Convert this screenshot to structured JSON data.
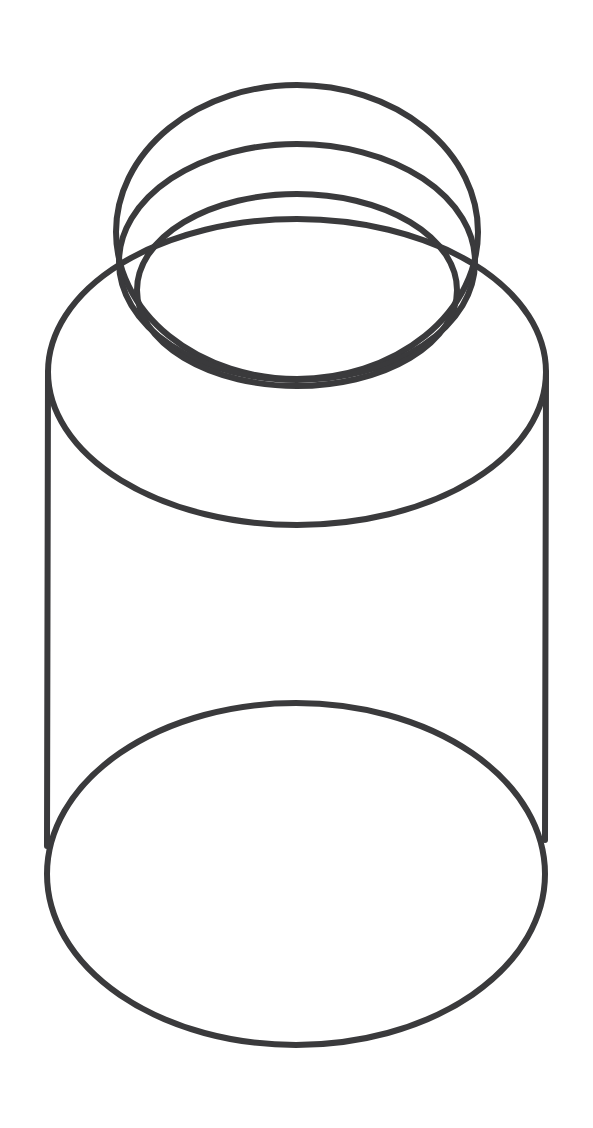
{
  "figure": {
    "view": "three-quarter perspective line drawing",
    "style": "black-and-white line art, no fill",
    "background_color": "#ffffff",
    "line_color": "#3a3a3c",
    "line_width": 6,
    "canvas": {
      "width": 593,
      "height": 1128
    }
  },
  "parts": [
    {
      "id": "rim-ellipse",
      "label": "Rim opening ellipse (outermost top ring)",
      "shape": "ellipse",
      "cx": 297,
      "cy": 232,
      "rx": 181,
      "ry": 147
    },
    {
      "id": "neck-ring-upper",
      "label": "Upper neck ring ellipse",
      "shape": "ellipse",
      "cx": 297,
      "cy": 262,
      "rx": 178,
      "ry": 118
    },
    {
      "id": "neck-ring-lower",
      "label": "Lower neck ring ellipse",
      "shape": "ellipse",
      "cx": 297,
      "cy": 290,
      "rx": 160,
      "ry": 96
    },
    {
      "id": "shoulder-ellipse",
      "label": "Body shoulder ellipse (top of jar body)",
      "shape": "ellipse",
      "cx": 297,
      "cy": 372,
      "rx": 249,
      "ry": 153
    },
    {
      "id": "base-ellipse",
      "label": "Base ellipse (bottom of jar body)",
      "shape": "ellipse",
      "cx": 296,
      "cy": 874,
      "rx": 249,
      "ry": 171
    },
    {
      "id": "wall-left",
      "label": "Left vertical body wall",
      "shape": "line",
      "x1": 48,
      "y1": 372,
      "x2": 47,
      "y2": 846
    },
    {
      "id": "wall-right",
      "label": "Right vertical body wall",
      "shape": "line",
      "x1": 546,
      "y1": 372,
      "x2": 545,
      "y2": 840
    }
  ],
  "intersections": [
    {
      "id": "left-node",
      "label": "Left rim/shoulder crossing point",
      "x": 117,
      "y": 235
    },
    {
      "id": "right-node",
      "label": "Right rim/shoulder crossing point",
      "x": 478,
      "y": 237
    }
  ],
  "caption": ""
}
